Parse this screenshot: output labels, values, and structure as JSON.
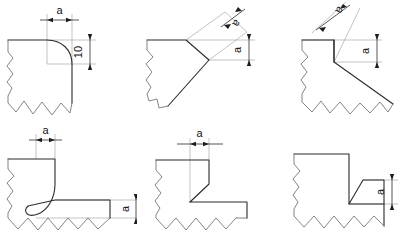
{
  "drawing": {
    "title": "Weld seam thickness designation details",
    "background_color": "#ffffff",
    "object_line_color": "#2b2b2b",
    "break_line_color": "#6e6e6e",
    "extension_line_color": "#9a9a9a",
    "dimension_line_color": "#1d1d1d",
    "text_color": "#111111"
  },
  "panels": [
    {
      "id": "panel-1",
      "name": "fillet-radius-corner",
      "dimensions": [
        {
          "label": "a",
          "orientation": "horizontal",
          "position": "top"
        },
        {
          "label": "10",
          "orientation": "vertical",
          "position": "right"
        }
      ]
    },
    {
      "id": "panel-2",
      "name": "angled-bevel-corner",
      "dimensions": [
        {
          "label": "a",
          "orientation": "angled",
          "position": "top-right"
        },
        {
          "label": "a",
          "orientation": "vertical",
          "position": "right"
        }
      ]
    },
    {
      "id": "panel-3",
      "name": "steep-angled-cut",
      "dimensions": [
        {
          "label": "a",
          "orientation": "angled",
          "position": "top"
        },
        {
          "label": "a",
          "orientation": "vertical",
          "position": "right"
        }
      ]
    },
    {
      "id": "panel-4",
      "name": "rounded-step-joint",
      "dimensions": [
        {
          "label": "a",
          "orientation": "horizontal",
          "position": "top"
        },
        {
          "label": "a",
          "orientation": "vertical",
          "position": "right"
        }
      ]
    },
    {
      "id": "panel-5",
      "name": "chamfered-step-joint",
      "dimensions": [
        {
          "label": "a",
          "orientation": "horizontal",
          "position": "top"
        }
      ]
    },
    {
      "id": "panel-6",
      "name": "notched-corner-joint",
      "dimensions": [
        {
          "label": "a",
          "orientation": "vertical",
          "position": "right"
        }
      ]
    }
  ]
}
